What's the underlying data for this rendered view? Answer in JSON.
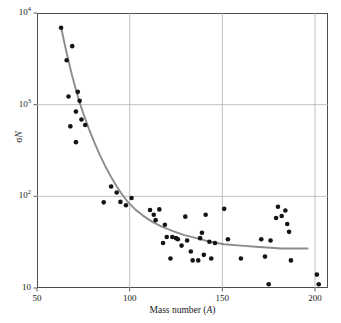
{
  "chart_data": {
    "type": "scatter",
    "title": "",
    "xlabel": "Mass number (A)",
    "ylabel": "σN",
    "xlim": [
      50,
      207
    ],
    "ylim": [
      10,
      10000
    ],
    "yscale": "log",
    "xscale": "linear",
    "grid": true,
    "legend": null,
    "xticks": [
      50,
      100,
      150,
      200
    ],
    "xticklabels": [
      "50",
      "100",
      "150",
      "200"
    ],
    "yticks": [
      10,
      100,
      1000,
      10000
    ],
    "yticklabels": [
      "10",
      "10²",
      "10³",
      "10⁴"
    ],
    "marker": {
      "shape": "circle",
      "color": "#141414",
      "size": 4.6
    },
    "points": [
      {
        "x": 63,
        "y": 6900
      },
      {
        "x": 66,
        "y": 3050
      },
      {
        "x": 69,
        "y": 4350
      },
      {
        "x": 67,
        "y": 1230
      },
      {
        "x": 72,
        "y": 1380
      },
      {
        "x": 73,
        "y": 1100
      },
      {
        "x": 71,
        "y": 840
      },
      {
        "x": 68,
        "y": 580
      },
      {
        "x": 74,
        "y": 690
      },
      {
        "x": 76,
        "y": 600
      },
      {
        "x": 71,
        "y": 390
      },
      {
        "x": 86,
        "y": 86
      },
      {
        "x": 90,
        "y": 128
      },
      {
        "x": 93,
        "y": 110
      },
      {
        "x": 95,
        "y": 87
      },
      {
        "x": 98,
        "y": 80
      },
      {
        "x": 101,
        "y": 96
      },
      {
        "x": 111,
        "y": 71
      },
      {
        "x": 114,
        "y": 55
      },
      {
        "x": 116,
        "y": 72
      },
      {
        "x": 113,
        "y": 63
      },
      {
        "x": 119,
        "y": 49
      },
      {
        "x": 120,
        "y": 36
      },
      {
        "x": 118,
        "y": 31
      },
      {
        "x": 123,
        "y": 36
      },
      {
        "x": 122,
        "y": 21
      },
      {
        "x": 126,
        "y": 34
      },
      {
        "x": 128,
        "y": 29
      },
      {
        "x": 130,
        "y": 60
      },
      {
        "x": 125,
        "y": 35
      },
      {
        "x": 131,
        "y": 33
      },
      {
        "x": 134,
        "y": 20
      },
      {
        "x": 133,
        "y": 25
      },
      {
        "x": 137,
        "y": 20
      },
      {
        "x": 139,
        "y": 40
      },
      {
        "x": 138,
        "y": 35
      },
      {
        "x": 141,
        "y": 63
      },
      {
        "x": 140,
        "y": 23
      },
      {
        "x": 143,
        "y": 32
      },
      {
        "x": 144,
        "y": 21
      },
      {
        "x": 146,
        "y": 31
      },
      {
        "x": 151,
        "y": 73
      },
      {
        "x": 153,
        "y": 34
      },
      {
        "x": 160,
        "y": 21
      },
      {
        "x": 171,
        "y": 34
      },
      {
        "x": 173,
        "y": 22
      },
      {
        "x": 175,
        "y": 11
      },
      {
        "x": 176,
        "y": 33
      },
      {
        "x": 179,
        "y": 58
      },
      {
        "x": 180,
        "y": 77
      },
      {
        "x": 182,
        "y": 61
      },
      {
        "x": 184,
        "y": 70
      },
      {
        "x": 185,
        "y": 50
      },
      {
        "x": 186,
        "y": 41
      },
      {
        "x": 187,
        "y": 20
      },
      {
        "x": 201,
        "y": 14
      },
      {
        "x": 202,
        "y": 11
      }
    ],
    "fit_curve": {
      "name": "fit-line",
      "color": "#8c8c8c",
      "width": 1.9,
      "x_start": 63,
      "x_end": 196,
      "y_start": 7000,
      "y_end": 27,
      "samples": [
        {
          "x": 63,
          "y": 7000
        },
        {
          "x": 65,
          "y": 4500
        },
        {
          "x": 67,
          "y": 3000
        },
        {
          "x": 69,
          "y": 2050
        },
        {
          "x": 71,
          "y": 1450
        },
        {
          "x": 73,
          "y": 1060
        },
        {
          "x": 75,
          "y": 800
        },
        {
          "x": 78,
          "y": 545
        },
        {
          "x": 81,
          "y": 385
        },
        {
          "x": 84,
          "y": 280
        },
        {
          "x": 87,
          "y": 210
        },
        {
          "x": 90,
          "y": 162
        },
        {
          "x": 93,
          "y": 128
        },
        {
          "x": 96,
          "y": 104
        },
        {
          "x": 99,
          "y": 87
        },
        {
          "x": 103,
          "y": 72
        },
        {
          "x": 107,
          "y": 62
        },
        {
          "x": 112,
          "y": 53
        },
        {
          "x": 117,
          "y": 47
        },
        {
          "x": 123,
          "y": 42
        },
        {
          "x": 129,
          "y": 38
        },
        {
          "x": 136,
          "y": 35
        },
        {
          "x": 143,
          "y": 32
        },
        {
          "x": 151,
          "y": 30
        },
        {
          "x": 160,
          "y": 29
        },
        {
          "x": 170,
          "y": 28
        },
        {
          "x": 182,
          "y": 27
        },
        {
          "x": 196,
          "y": 27
        }
      ]
    }
  },
  "axes": {
    "x_title_prefix": "Mass number (",
    "x_title_italic": "A",
    "x_title_suffix": ")",
    "y_title_prefix": "σ",
    "y_title_italic": "N"
  },
  "style": {
    "frame_color": "#4d4d4d",
    "grid_color": "#b0b0b0",
    "point_color": "#141414",
    "curve_color": "#8c8c8c",
    "background": "#ffffff"
  }
}
